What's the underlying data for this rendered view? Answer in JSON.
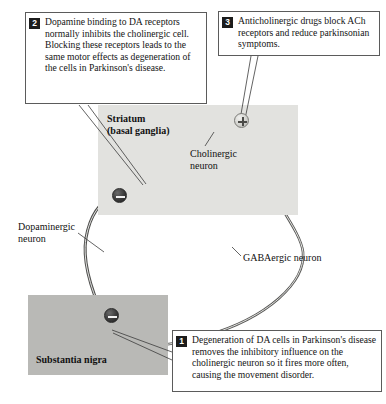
{
  "figure": {
    "background_color": "#ffffff"
  },
  "regions": [
    {
      "id": "striatum",
      "label": "Striatum\n(basal ganglia)",
      "fill": "#e2e2df"
    },
    {
      "id": "substantia_nigra",
      "label": "Substantia nigra",
      "fill": "#b9b9b6"
    }
  ],
  "labels": {
    "cholinergic": "Cholinergic\nneuron",
    "dopaminergic": "Dopaminergic\nneuron",
    "gabaergic": "GABAergic neuron"
  },
  "signs": [
    {
      "id": "striatal-inhibition",
      "symbol": "−",
      "type": "minus"
    },
    {
      "id": "cholinergic-excitation",
      "symbol": "+",
      "type": "plus"
    },
    {
      "id": "nigra-inhibition",
      "symbol": "−",
      "type": "minus"
    }
  ],
  "callouts": [
    {
      "number": "1",
      "text": "Degeneration of DA cells in Parkinson's disease removes the inhibitory influence on the cholinergic neuron so it fires more often, causing the movement disorder."
    },
    {
      "number": "2",
      "text": "Dopamine binding to DA receptors normally inhibits the cholinergic cell. Blocking these receptors leads to the same motor effects as degeneration of the cells in Parkinson's disease."
    },
    {
      "number": "3",
      "text": "Anticholinergic drugs block ACh receptors and reduce parkinsonian symptoms."
    }
  ],
  "colors": {
    "box_border": "#5b5b5b",
    "badge_bg": "#1c1c1c",
    "badge_text": "#ffffff",
    "axon_stroke": "#5a5a58",
    "soma_fill": "#d6d6d2",
    "text": "#141414"
  }
}
